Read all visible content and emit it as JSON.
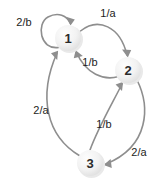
{
  "diagram": {
    "type": "finite-state-machine",
    "background_color": "#ffffff",
    "node_fill_color": "#ededed",
    "node_shadow_color": "#e3e3e3",
    "edge_color": "#8e8e8e",
    "label_color": "#1d1d1d",
    "states": [
      {
        "id": "1",
        "label": "1",
        "cx": 68,
        "cy": 38,
        "r": 13
      },
      {
        "id": "2",
        "label": "2",
        "cx": 128,
        "cy": 70,
        "r": 13
      },
      {
        "id": "3",
        "label": "3",
        "cx": 90,
        "cy": 163,
        "r": 13
      }
    ],
    "transitions": [
      {
        "id": "t1",
        "from": "1",
        "to": "1",
        "label": "2/b",
        "label_x": 24,
        "label_y": 22,
        "kind": "self-loop"
      },
      {
        "id": "t2",
        "from": "1",
        "to": "2",
        "label": "1/a",
        "label_x": 108,
        "label_y": 13,
        "kind": "arc-top"
      },
      {
        "id": "t3",
        "from": "2",
        "to": "1",
        "label": "1/b",
        "label_x": 90,
        "label_y": 62,
        "kind": "arc-return"
      },
      {
        "id": "t4",
        "from": "3",
        "to": "1",
        "label": "2/a",
        "label_x": 41,
        "label_y": 110,
        "kind": "long-left-curve"
      },
      {
        "id": "t5",
        "from": "3",
        "to": "2",
        "label": "1/b",
        "label_x": 104,
        "label_y": 124,
        "kind": "inner-right-curve"
      },
      {
        "id": "t6",
        "from": "2",
        "to": "3",
        "label": "2/a",
        "label_x": 139,
        "label_y": 152,
        "kind": "outer-right-curve"
      }
    ]
  }
}
